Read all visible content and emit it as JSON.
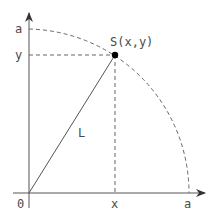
{
  "diagram": {
    "colors": {
      "line": "#555555",
      "dash": "#666666",
      "point": "#000000",
      "text": "#4a4a4a"
    },
    "origin": {
      "px": 29,
      "py": 193
    },
    "radius": 160,
    "point_S": {
      "px": 115,
      "py": 55
    },
    "labels": {
      "origin": "0",
      "x_axis_a": "a",
      "y_axis_a": "a",
      "x_proj": "x",
      "y_proj": "y",
      "point": "S(x,y)",
      "segment": "L"
    }
  }
}
